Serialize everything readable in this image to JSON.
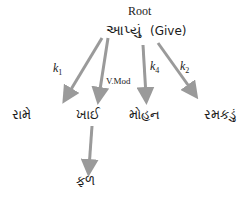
{
  "diagram": {
    "root_label": "Root",
    "root": {
      "word": "આપ્યું",
      "gloss": "(Give)"
    },
    "edges": [
      {
        "label": "k",
        "sub": "1",
        "from": "આપ્યું",
        "to": "રામે"
      },
      {
        "label": "V.Mod",
        "from": "આપ્યું",
        "to": "ખાઈ"
      },
      {
        "label": "k",
        "sub": "4",
        "from": "આપ્યું",
        "to": "મોહન"
      },
      {
        "label": "k",
        "sub": "2",
        "from": "આપ્યું",
        "to": "રમકડું"
      },
      {
        "label": "",
        "from": "ખાઈ",
        "to": "ફળ"
      }
    ],
    "children": [
      "રામે",
      "ખાઈ",
      "મોહન",
      "રમકડું"
    ],
    "grandchild": "ફળ",
    "arrow_color": "#9a9a9a"
  }
}
